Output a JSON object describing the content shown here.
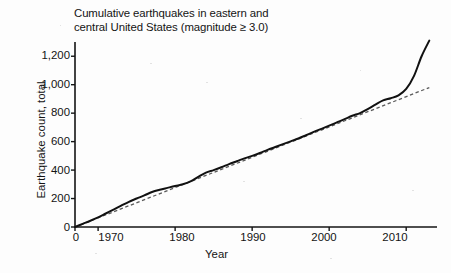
{
  "chart_data": {
    "type": "line",
    "title": "Cumulative earthquakes in eastern and\ncentral United States (magnitude ≥ 3.0)",
    "xlabel": "Year",
    "ylabel": "Earthquake count, total",
    "xlim": [
      1967,
      2014
    ],
    "ylim": [
      0,
      1300
    ],
    "grid": false,
    "legend": "none",
    "x_ticks": [
      "0",
      "1970",
      "1980",
      "1990",
      "2000",
      "2010"
    ],
    "x_tick_values": [
      1967,
      1970,
      1980,
      1990,
      2000,
      2010
    ],
    "y_ticks": [
      "0",
      "200",
      "400",
      "600",
      "800",
      "1,000",
      "1,200"
    ],
    "y_tick_values": [
      0,
      200,
      400,
      600,
      800,
      1000,
      1200
    ],
    "series": [
      {
        "name": "Cumulative earthquake count",
        "style": "solid",
        "color": "#111111",
        "x": [
          1967,
          1968,
          1969,
          1970,
          1971,
          1972,
          1973,
          1974,
          1975,
          1976,
          1977,
          1978,
          1979,
          1980,
          1981,
          1982,
          1983,
          1984,
          1985,
          1986,
          1987,
          1988,
          1989,
          1990,
          1991,
          1992,
          1993,
          1994,
          1995,
          1996,
          1997,
          1998,
          1999,
          2000,
          2001,
          2002,
          2003,
          2004,
          2005,
          2006,
          2007,
          2008,
          2009,
          2010,
          2011,
          2012,
          2013
        ],
        "y": [
          0,
          22,
          44,
          68,
          95,
          122,
          150,
          177,
          200,
          222,
          246,
          262,
          275,
          288,
          300,
          320,
          352,
          382,
          400,
          420,
          442,
          462,
          482,
          500,
          520,
          542,
          562,
          582,
          602,
          622,
          645,
          668,
          690,
          712,
          735,
          758,
          782,
          800,
          828,
          860,
          890,
          905,
          925,
          970,
          1060,
          1200,
          1310
        ]
      },
      {
        "name": "Linear trend",
        "style": "dashed",
        "color": "#5a5a5a",
        "x": [
          1967,
          2013
        ],
        "y": [
          0,
          980
        ]
      }
    ],
    "annotations": [
      "Solid curve tracks cumulative count; it departs sharply above the dashed linear trend after about 2009.",
      "Dashed straight reference line rises from 0 at 1967 to about 980 by 2013."
    ]
  }
}
